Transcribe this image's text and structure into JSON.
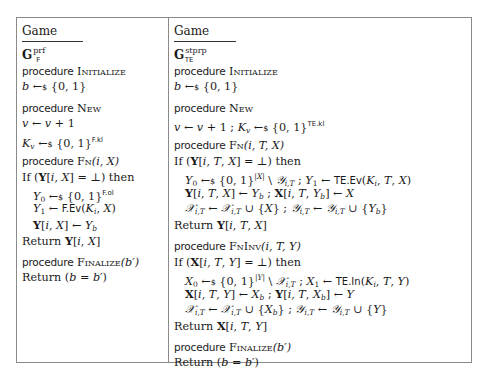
{
  "left_game": {
    "title_word": "Game",
    "title_symbol": "G",
    "title_superscript": "prf",
    "title_subscript": "F",
    "procedures": [
      {
        "header_kw": "procedure",
        "header_name": "Initialize",
        "header_args": "",
        "body": [
          "b ←$ {0,1}"
        ]
      },
      {
        "header_kw": "procedure",
        "header_name": "New",
        "header_args": "",
        "body": [
          "v ← v + 1",
          "K_v ←$ {0,1}^{F.kl}"
        ]
      },
      {
        "header_kw": "procedure",
        "header_name": "Fn",
        "header_args": "(i, X)",
        "body": [
          "If (Y[i, X] = ⊥) then",
          "Y_0 ←$ {0,1}^{F.ol}",
          "Y_1 ← F.Ev(K_i, X)",
          "Y[i, X] ← Y_b",
          "Return Y[i, X]"
        ]
      },
      {
        "header_kw": "procedure",
        "header_name": "Finalize",
        "header_args": "(b′)",
        "body": [
          "Return (b = b′)"
        ]
      }
    ]
  },
  "right_game": {
    "title_word": "Game",
    "title_symbol": "G",
    "title_superscript": "stprp",
    "title_subscript": "TE",
    "procedures": [
      {
        "header_kw": "procedure",
        "header_name": "Initialize",
        "header_args": "",
        "body": [
          "b ←$ {0,1}"
        ]
      },
      {
        "header_kw": "procedure",
        "header_name": "New",
        "header_args": "",
        "body": [
          "v ← v + 1 ; K_v ←$ {0,1}^{TE.kl}"
        ]
      },
      {
        "header_kw": "procedure",
        "header_name": "Fn",
        "header_args": "(i, T, X)",
        "body": [
          "If (Y[i, T, X] = ⊥) then",
          "Y_0 ←$ {0,1}^{|X|} \\ 𝒴_{i,T} ; Y_1 ← TE.Ev(K_i, T, X)",
          "Y[i, T, X] ← Y_b ; X[i, T, Y_b] ← X",
          "𝒳_{i,T} ← 𝒳_{i,T} ∪ {X} ; 𝒴_{i,T} ← 𝒴_{i,T} ∪ {Y_b}",
          "Return Y[i, T, X]"
        ]
      },
      {
        "header_kw": "procedure",
        "header_name": "FnInv",
        "header_args": "(i, T, Y)",
        "body": [
          "If (X[i, T, Y] = ⊥) then",
          "X_0 ←$ {0,1}^{|Y|} \\ 𝒳_{i,T} ; X_1 ← TE.In(K_i, T, Y)",
          "X[i, T, Y] ← X_b ; Y[i, T, X_b] ← Y",
          "𝒳_{i,T} ← 𝒳_{i,T} ∪ {X_b} ; 𝒴_{i,T} ← 𝒴_{i,T} ∪ {Y}",
          "Return X[i, T, Y]"
        ]
      },
      {
        "header_kw": "procedure",
        "header_name": "Finalize",
        "header_args": "(b′)",
        "body": [
          "Return (b = b′)"
        ]
      }
    ]
  },
  "tokens": {
    "procedure": "procedure",
    "initialize": "Initialize",
    "new": "New",
    "fn": "Fn",
    "fninv": "FnInv",
    "finalize": "Finalize",
    "if": "If",
    "then": "then",
    "return": "Return",
    "game": "Game"
  }
}
